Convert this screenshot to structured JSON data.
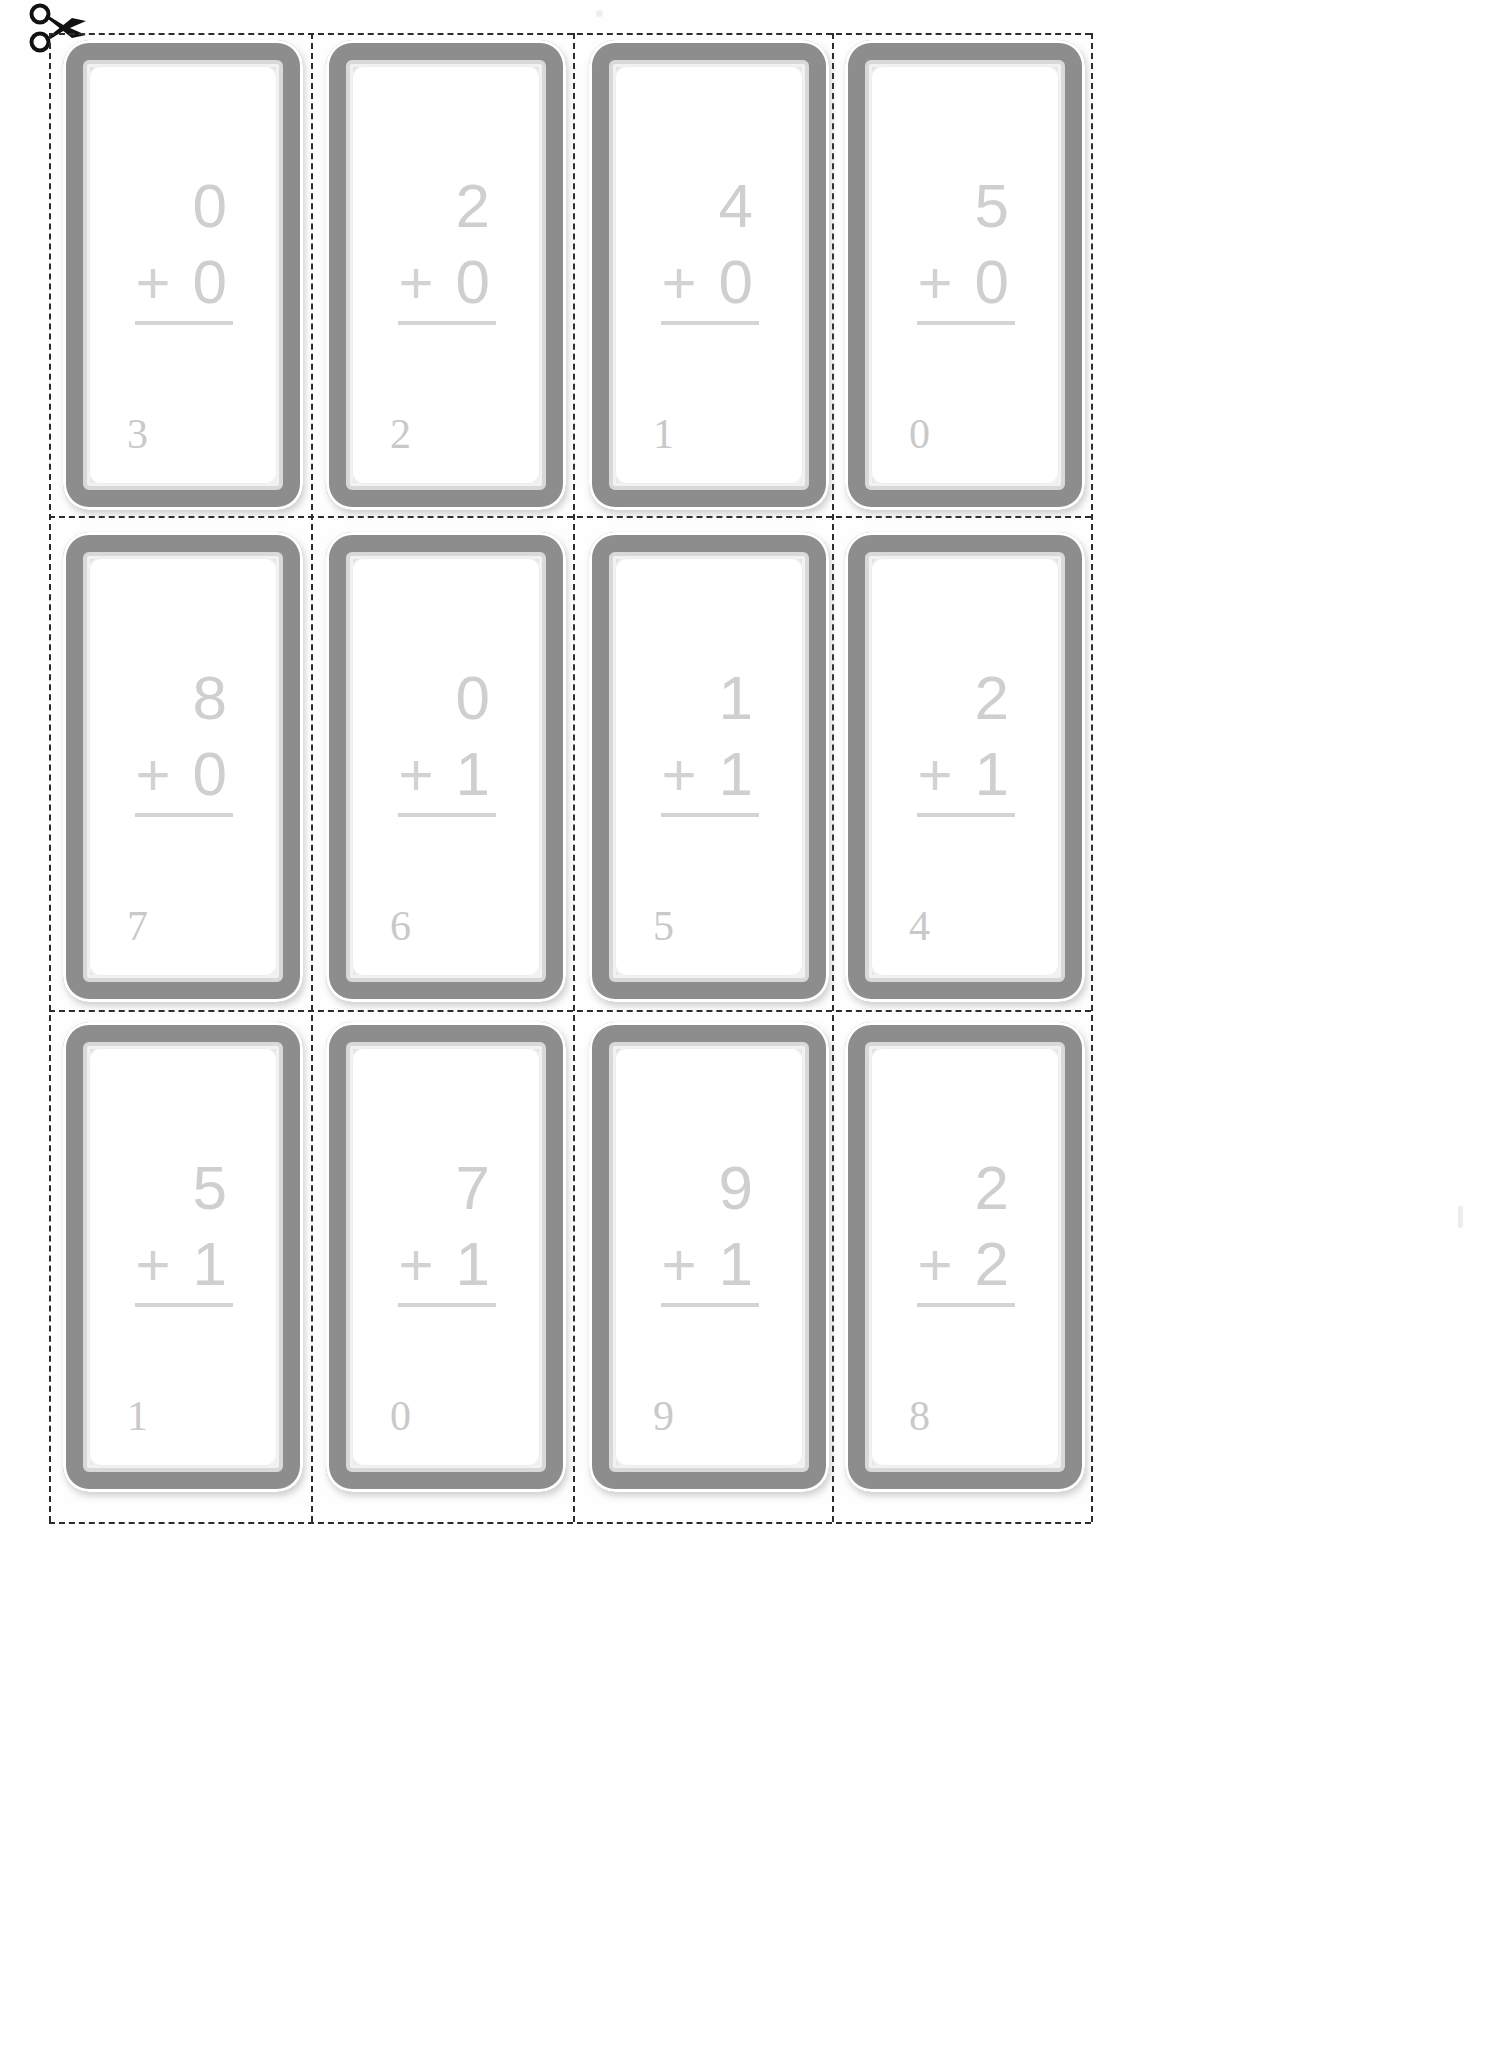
{
  "page": {
    "icon": "scissors-icon",
    "background_color": "#ffffff",
    "number_color": "#cfcfcf",
    "cutline_color": "#2c2c2c",
    "card_frame_color": "#8d8d8d",
    "rows": 3,
    "columns": 4,
    "card_count": 12
  },
  "cards": [
    {
      "id": "card-1",
      "row": 1,
      "col": 1,
      "top_addend": "0",
      "operator": "+",
      "bottom_addend": "0",
      "corner_number": "3"
    },
    {
      "id": "card-2",
      "row": 1,
      "col": 2,
      "top_addend": "2",
      "operator": "+",
      "bottom_addend": "0",
      "corner_number": "2"
    },
    {
      "id": "card-3",
      "row": 1,
      "col": 3,
      "top_addend": "4",
      "operator": "+",
      "bottom_addend": "0",
      "corner_number": "1"
    },
    {
      "id": "card-4",
      "row": 1,
      "col": 4,
      "top_addend": "5",
      "operator": "+",
      "bottom_addend": "0",
      "corner_number": "0"
    },
    {
      "id": "card-5",
      "row": 2,
      "col": 1,
      "top_addend": "8",
      "operator": "+",
      "bottom_addend": "0",
      "corner_number": "7"
    },
    {
      "id": "card-6",
      "row": 2,
      "col": 2,
      "top_addend": "0",
      "operator": "+",
      "bottom_addend": "1",
      "corner_number": "6"
    },
    {
      "id": "card-7",
      "row": 2,
      "col": 3,
      "top_addend": "1",
      "operator": "+",
      "bottom_addend": "1",
      "corner_number": "5"
    },
    {
      "id": "card-8",
      "row": 2,
      "col": 4,
      "top_addend": "2",
      "operator": "+",
      "bottom_addend": "1",
      "corner_number": "4"
    },
    {
      "id": "card-9",
      "row": 3,
      "col": 1,
      "top_addend": "5",
      "operator": "+",
      "bottom_addend": "1",
      "corner_number": "1"
    },
    {
      "id": "card-10",
      "row": 3,
      "col": 2,
      "top_addend": "7",
      "operator": "+",
      "bottom_addend": "1",
      "corner_number": "0"
    },
    {
      "id": "card-11",
      "row": 3,
      "col": 3,
      "top_addend": "9",
      "operator": "+",
      "bottom_addend": "1",
      "corner_number": "9"
    },
    {
      "id": "card-12",
      "row": 3,
      "col": 4,
      "top_addend": "2",
      "operator": "+",
      "bottom_addend": "2",
      "corner_number": "8"
    }
  ],
  "layout": {
    "card_x": [
      63,
      326,
      589,
      845
    ],
    "card_y": [
      40,
      532,
      1022
    ],
    "card_width": 240,
    "card_height": 470,
    "cut_v_x": [
      49,
      311,
      573,
      832,
      1091
    ],
    "cut_h_y": [
      33,
      516,
      1010,
      1522
    ],
    "cut_left": 49,
    "cut_right": 1091
  }
}
